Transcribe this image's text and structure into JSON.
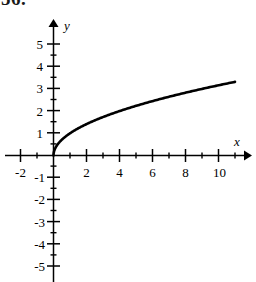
{
  "problem": {
    "number": "56."
  },
  "chart_data": {
    "type": "line",
    "title": "",
    "subtitle": "",
    "function": "y = sqrt(x)",
    "xlabel": "x",
    "ylabel": "y",
    "xlim": [
      -2.9,
      11.8
    ],
    "ylim": [
      -5.5,
      5.6
    ],
    "grid": false,
    "legend": null,
    "axes": {
      "x_axis_label": "x",
      "y_axis_label": "y",
      "x_major_tick_labels": [
        "-2",
        "2",
        "4",
        "6",
        "8",
        "10"
      ],
      "x_major_tick_values": [
        -2,
        2,
        4,
        6,
        8,
        10
      ],
      "x_minor_tick_values": [
        -1,
        1,
        3,
        5,
        7,
        9,
        11
      ],
      "y_major_tick_labels": [
        "5",
        "4",
        "3",
        "2",
        "1",
        "-1",
        "-2",
        "-3",
        "-4",
        "-5"
      ],
      "y_major_tick_values": [
        5,
        4,
        3,
        2,
        1,
        -1,
        -2,
        -3,
        -4,
        -5
      ],
      "y_minor_tick_values": [
        4.5,
        3.5,
        2.5,
        1.5,
        0.5,
        -0.5,
        -1.5,
        -2.5,
        -3.5,
        -4.5
      ],
      "origin_label": "",
      "x_arrow": true,
      "y_arrow": true
    },
    "series": [
      {
        "name": "y = sqrt(x)",
        "x": [
          0,
          0.1,
          0.25,
          0.5,
          0.75,
          1,
          1.5,
          2,
          3,
          4,
          5,
          6,
          7,
          8,
          9,
          10,
          11
        ],
        "y": [
          0,
          0.32,
          0.5,
          0.71,
          0.87,
          1,
          1.22,
          1.41,
          1.73,
          2,
          2.24,
          2.45,
          2.65,
          2.83,
          3,
          3.16,
          3.32
        ],
        "color": "#000000",
        "style": "solid"
      }
    ],
    "annotations": []
  },
  "colors": {
    "ink": "#000000",
    "background": "#ffffff"
  }
}
